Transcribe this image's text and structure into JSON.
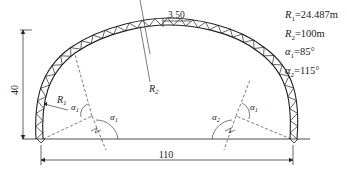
{
  "diagram": {
    "dimensions": {
      "height_label": "40",
      "span_label": "110",
      "truss_depth_label": "3.50"
    },
    "labels": {
      "r1": "R",
      "r1_sub": "1",
      "r2": "R",
      "r2_sub": "2",
      "alpha": "α",
      "alpha1_sub": "1",
      "alpha2_sub": "2"
    },
    "legend": [
      {
        "symbol": "R",
        "sub": "1",
        "value": "=24.487m"
      },
      {
        "symbol": "R",
        "sub": "2",
        "value": "=100m"
      },
      {
        "symbol": "α",
        "sub": "1",
        "value": "=85°"
      },
      {
        "symbol": "α",
        "sub": "2",
        "value": "=115°"
      }
    ],
    "colors": {
      "line": "#222222",
      "background": "#ffffff"
    }
  }
}
